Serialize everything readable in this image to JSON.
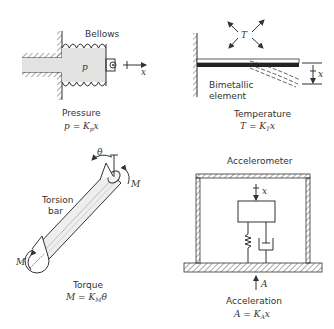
{
  "figure": {
    "panels": [
      {
        "id": "pressure",
        "component_label": "Bellows",
        "variable_label": "p",
        "displacement_label": "x",
        "caption": "Pressure",
        "equation": {
          "lhs": "p",
          "eq": " = ",
          "k": "K",
          "k_sub": "p",
          "x": "x"
        }
      },
      {
        "id": "temperature",
        "component_label_line1": "Bimetallic",
        "component_label_line2": "element",
        "variable_label": "T",
        "displacement_label": "x",
        "caption": "Temperature",
        "equation": {
          "lhs": "T",
          "eq": " = ",
          "k": "K",
          "k_sub": "T",
          "x": "x"
        }
      },
      {
        "id": "torque",
        "component_label_line1": "Torsion",
        "component_label_line2": "bar",
        "angle_label": "θ",
        "moment_label": "M",
        "caption": "Torque",
        "equation": {
          "lhs": "M",
          "eq": " = ",
          "k": "K",
          "k_sub": "M",
          "x": "θ"
        }
      },
      {
        "id": "acceleration",
        "component_label": "Accelerometer",
        "input_label": "A",
        "displacement_label": "x",
        "caption": "Acceleration",
        "equation": {
          "lhs": "A",
          "eq": " = ",
          "k": "K",
          "k_sub": "A",
          "x": "x"
        }
      }
    ]
  }
}
